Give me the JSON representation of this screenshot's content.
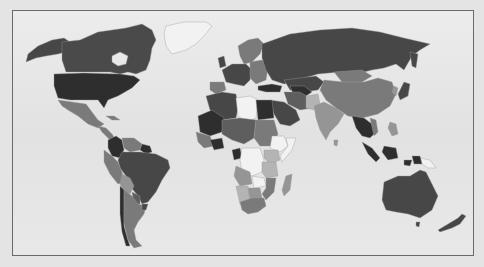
{
  "map": {
    "type": "choropleth",
    "projection": "equirectangular-like world map",
    "background_color": "#e4e4e4",
    "frame_border_color": "#6a6a6a",
    "ocean_color": "#e8e8e8",
    "shade_palette": {
      "darkest": "#2e2e2e",
      "dark": "#474747",
      "medium_dark": "#5e5e5e",
      "medium": "#7a7a7a",
      "medium_light": "#959595",
      "light": "#b4b4b4",
      "lightest": "#f2f2f2"
    },
    "regions": [
      {
        "name": "Alaska",
        "shade": "dark"
      },
      {
        "name": "Canada",
        "shade": "dark"
      },
      {
        "name": "Greenland",
        "shade": "lightest"
      },
      {
        "name": "United States",
        "shade": "darkest"
      },
      {
        "name": "Mexico",
        "shade": "medium"
      },
      {
        "name": "Central America",
        "shade": "medium"
      },
      {
        "name": "Cuba",
        "shade": "medium"
      },
      {
        "name": "Colombia",
        "shade": "darkest"
      },
      {
        "name": "Venezuela",
        "shade": "medium"
      },
      {
        "name": "Guyana",
        "shade": "darkest"
      },
      {
        "name": "Brazil",
        "shade": "dark"
      },
      {
        "name": "Peru",
        "shade": "medium"
      },
      {
        "name": "Bolivia",
        "shade": "medium_light"
      },
      {
        "name": "Chile",
        "shade": "darkest"
      },
      {
        "name": "Argentina",
        "shade": "medium"
      },
      {
        "name": "Paraguay",
        "shade": "medium_dark"
      },
      {
        "name": "Uruguay",
        "shade": "dark"
      },
      {
        "name": "Russia",
        "shade": "dark"
      },
      {
        "name": "Scandinavia",
        "shade": "medium"
      },
      {
        "name": "Western Europe",
        "shade": "dark"
      },
      {
        "name": "Eastern Europe",
        "shade": "medium"
      },
      {
        "name": "Iberia",
        "shade": "medium"
      },
      {
        "name": "Turkey",
        "shade": "darkest"
      },
      {
        "name": "Kazakhstan",
        "shade": "dark"
      },
      {
        "name": "Central Asia",
        "shade": "darkest"
      },
      {
        "name": "China",
        "shade": "medium"
      },
      {
        "name": "Mongolia",
        "shade": "medium"
      },
      {
        "name": "India",
        "shade": "medium_light"
      },
      {
        "name": "Iran",
        "shade": "medium_dark"
      },
      {
        "name": "Saudi Arabia",
        "shade": "dark"
      },
      {
        "name": "Pakistan",
        "shade": "light"
      },
      {
        "name": "Southeast Asia",
        "shade": "darkest"
      },
      {
        "name": "Japan",
        "shade": "dark"
      },
      {
        "name": "Indonesia",
        "shade": "darkest"
      },
      {
        "name": "Papua New Guinea",
        "shade": "lightest"
      },
      {
        "name": "Philippines",
        "shade": "medium_light"
      },
      {
        "name": "Algeria",
        "shade": "dark"
      },
      {
        "name": "Libya",
        "shade": "lightest"
      },
      {
        "name": "Egypt",
        "shade": "darkest"
      },
      {
        "name": "Mali/Mauritania",
        "shade": "darkest"
      },
      {
        "name": "Niger/Chad",
        "shade": "medium_dark"
      },
      {
        "name": "Sudan",
        "shade": "medium"
      },
      {
        "name": "West Africa",
        "shade": "medium"
      },
      {
        "name": "Nigeria",
        "shade": "darkest"
      },
      {
        "name": "Ethiopia",
        "shade": "lightest"
      },
      {
        "name": "Somalia",
        "shade": "lightest"
      },
      {
        "name": "Kenya",
        "shade": "light"
      },
      {
        "name": "DR Congo",
        "shade": "lightest"
      },
      {
        "name": "Gabon/Congo",
        "shade": "darkest"
      },
      {
        "name": "Angola",
        "shade": "medium_light"
      },
      {
        "name": "Tanzania",
        "shade": "light"
      },
      {
        "name": "Zambia",
        "shade": "lightest"
      },
      {
        "name": "Mozambique",
        "shade": "medium"
      },
      {
        "name": "Namibia",
        "shade": "light"
      },
      {
        "name": "Botswana",
        "shade": "medium_light"
      },
      {
        "name": "South Africa",
        "shade": "medium"
      },
      {
        "name": "Madagascar",
        "shade": "medium_light"
      },
      {
        "name": "Australia",
        "shade": "dark"
      },
      {
        "name": "New Zealand",
        "shade": "dark"
      },
      {
        "name": "Tasmania",
        "shade": "dark"
      }
    ]
  }
}
